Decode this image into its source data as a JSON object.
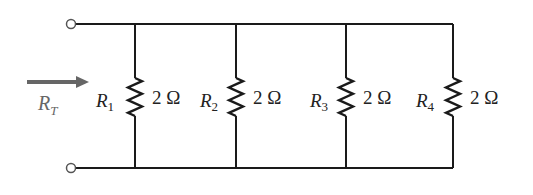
{
  "diagram": {
    "type": "parallel-resistor-circuit",
    "input_label": {
      "symbol": "R",
      "subscript": "T"
    },
    "colors": {
      "wire": "#1a1a1a",
      "arrow": "#666666",
      "label": "#222222"
    },
    "resistors": [
      {
        "name": "R",
        "subscript": "1",
        "value": "2 Ω",
        "x": 135
      },
      {
        "name": "R",
        "subscript": "2",
        "value": "2 Ω",
        "x": 236
      },
      {
        "name": "R",
        "subscript": "3",
        "value": "2 Ω",
        "x": 346
      },
      {
        "name": "R",
        "subscript": "4",
        "value": "2 Ω",
        "x": 453
      }
    ]
  }
}
